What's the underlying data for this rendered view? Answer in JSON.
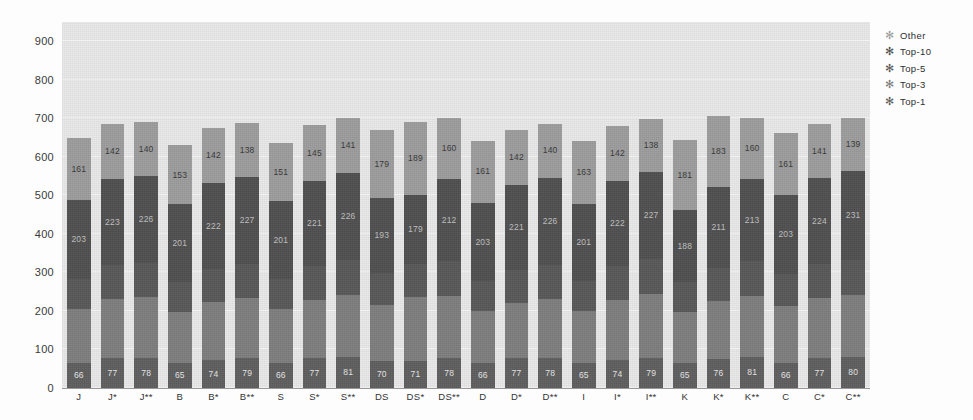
{
  "chart_data": {
    "type": "bar",
    "stacked": true,
    "title": "",
    "xlabel": "",
    "ylabel": "",
    "ylim": [
      0,
      950
    ],
    "yticks": [
      0,
      100,
      200,
      300,
      400,
      500,
      600,
      700,
      800,
      900
    ],
    "grid": true,
    "legend_position": "right",
    "categories": [
      "J",
      "J*",
      "J**",
      "B",
      "B*",
      "B**",
      "S",
      "S*",
      "S**",
      "DS",
      "DS*",
      "DS**",
      "D",
      "D*",
      "D**",
      "I",
      "I*",
      "I**",
      "K",
      "K*",
      "K**",
      "C",
      "C*",
      "C**"
    ],
    "series": [
      {
        "name": "Top-1",
        "color": "#5e5e5e",
        "values": [
          66,
          77,
          78,
          65,
          74,
          79,
          66,
          77,
          81,
          70,
          71,
          78,
          66,
          77,
          78,
          65,
          74,
          79,
          65,
          76,
          81,
          66,
          77,
          80
        ]
      },
      {
        "name": "Top-3",
        "color": "#7e7e7e",
        "values": [
          138,
          155,
          157,
          133,
          150,
          154,
          138,
          152,
          160,
          145,
          165,
          162,
          134,
          144,
          154,
          135,
          155,
          164,
          133,
          150,
          159,
          147,
          156,
          161
        ]
      },
      {
        "name": "Top-5",
        "color": "#585858",
        "values": [
          80,
          88,
          90,
          78,
          86,
          89,
          80,
          88,
          92,
          84,
          86,
          90,
          78,
          86,
          88,
          77,
          87,
          91,
          76,
          85,
          89,
          84,
          88,
          91
        ]
      },
      {
        "name": "Top-10",
        "color": "#4f4f4f",
        "values": [
          203,
          223,
          226,
          201,
          222,
          227,
          201,
          221,
          226,
          193,
          179,
          212,
          203,
          221,
          226,
          201,
          222,
          227,
          188,
          211,
          213,
          203,
          224,
          231
        ]
      },
      {
        "name": "Other",
        "color": "#9d9d9d",
        "values": [
          161,
          142,
          140,
          153,
          142,
          138,
          151,
          145,
          141,
          179,
          189,
          160,
          161,
          142,
          140,
          163,
          142,
          138,
          181,
          183,
          160,
          161,
          141,
          139
        ]
      }
    ],
    "legend_entries": [
      {
        "label": "Other",
        "marker": "asterisk-marker",
        "color": "#9d9d9d"
      },
      {
        "label": "Top-10",
        "marker": "asterisk-marker",
        "color": "#4f4f4f"
      },
      {
        "label": "Top-5",
        "marker": "asterisk-marker",
        "color": "#585858"
      },
      {
        "label": "Top-3",
        "marker": "asterisk-marker",
        "color": "#7e7e7e"
      },
      {
        "label": "Top-1",
        "marker": "asterisk-marker",
        "color": "#5e5e5e"
      }
    ]
  }
}
